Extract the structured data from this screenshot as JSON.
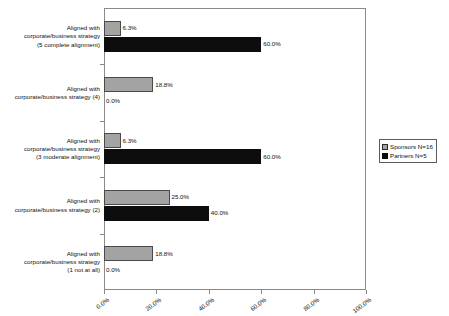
{
  "chart_data": {
    "type": "bar",
    "orientation": "horizontal",
    "title": "",
    "subtitle": "",
    "xlabel": "",
    "ylabel": "",
    "xlim": [
      0,
      100
    ],
    "grid": false,
    "legend_position": "right",
    "categories": [
      "Aligned with corporate/business strategy (5 complete alignment)",
      "Aligned with corporate/business strategy (4)",
      "Aligned with corporate/business strategy (3 moderate alignment)",
      "Aligned with corporate/business strategy (2)",
      "Aligned with corporate/business strategy (1 not at all)"
    ],
    "category_lines": [
      [
        "Aligned with",
        "corporate/business strategy",
        "(5 complete alignment)"
      ],
      [
        "Aligned with",
        "corporate/business strategy (4)"
      ],
      [
        "Aligned with",
        "corporate/business strategy",
        "(3 moderate alignment)"
      ],
      [
        "Aligned with",
        "corporate/business strategy (2)"
      ],
      [
        "Aligned with",
        "corporate/business strategy",
        "(1 not at all)"
      ]
    ],
    "series": [
      {
        "name": "Sponsors N=16",
        "color": "#a3a3a3",
        "values": [
          6.3,
          18.8,
          6.3,
          25.0,
          18.8
        ],
        "labels": [
          "6.3%",
          "18.8%",
          "6.3%",
          "25.0%",
          "18.8%"
        ]
      },
      {
        "name": "Partners N=5",
        "color": "#0d0d0d",
        "values": [
          60.0,
          0.0,
          60.0,
          40.0,
          0.0
        ],
        "labels": [
          "60.0%",
          "0.0%",
          "60.0%",
          "40.0%",
          "0.0%"
        ]
      }
    ],
    "xticks": [
      0,
      20,
      40,
      60,
      80,
      100
    ],
    "xtick_labels": [
      "0.0%",
      "20.0%",
      "40.0%",
      "60.0%",
      "80.0%",
      "100.0%"
    ]
  },
  "legend": {
    "items": [
      {
        "label": "Sponsors N=16",
        "swatch": "sponsors-swatch"
      },
      {
        "label": "Partners N=5",
        "swatch": "partners-swatch"
      }
    ]
  },
  "axis": {
    "x_tick_labels": [
      "0.0%",
      "20.0%",
      "40.0%",
      "60.0%",
      "80.0%",
      "100.0%"
    ]
  },
  "rows": [
    {
      "label_lines": [
        "Aligned with",
        "corporate/business strategy",
        "(5 complete alignment)"
      ],
      "sponsors_value": "6.3%",
      "partners_value": "60.0%"
    },
    {
      "label_lines": [
        "Aligned with",
        "corporate/business strategy (4)"
      ],
      "sponsors_value": "18.8%",
      "partners_value": "0.0%"
    },
    {
      "label_lines": [
        "Aligned with",
        "corporate/business strategy",
        "(3 moderate alignment)"
      ],
      "sponsors_value": "6.3%",
      "partners_value": "60.0%"
    },
    {
      "label_lines": [
        "Aligned with",
        "corporate/business strategy (2)"
      ],
      "sponsors_value": "25.0%",
      "partners_value": "40.0%"
    },
    {
      "label_lines": [
        "Aligned with",
        "corporate/business strategy",
        "(1 not at all)"
      ],
      "sponsors_value": "18.8%",
      "partners_value": "0.0%"
    }
  ]
}
